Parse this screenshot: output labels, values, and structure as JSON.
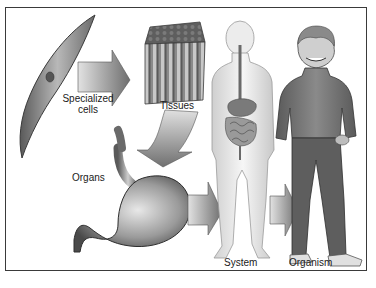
{
  "diagram": {
    "stages": [
      {
        "id": "cells",
        "label_line1": "Specialized",
        "label_line2": "cells"
      },
      {
        "id": "tissues",
        "label": "Tissues"
      },
      {
        "id": "organs",
        "label": "Organs"
      },
      {
        "id": "system",
        "label": "System"
      },
      {
        "id": "organism",
        "label": "Organism"
      }
    ],
    "flow": [
      "Specialized cells",
      "Tissues",
      "Organs",
      "System",
      "Organism"
    ],
    "colors": {
      "frame": "#3a3a3a",
      "arrow_light": "#d8d8d8",
      "arrow_dark": "#6a6a6a",
      "text": "#1a1a1a"
    }
  }
}
